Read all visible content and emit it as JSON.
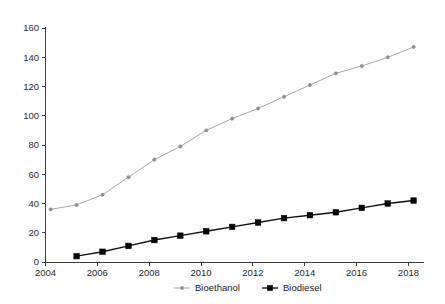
{
  "chart_data": {
    "type": "line",
    "title": "",
    "subtitle": "",
    "xlabel": "",
    "ylabel": "",
    "xlim": [
      2004,
      2018.6
    ],
    "ylim": [
      0,
      160
    ],
    "grid": false,
    "legend_position": "bottom-center",
    "x_ticks": [
      "2004",
      "2006",
      "2008",
      "2010",
      "2012",
      "2014",
      "2016",
      "2018"
    ],
    "x_tick_values": [
      2004,
      2006,
      2008,
      2010,
      2012,
      2014,
      2016,
      2018
    ],
    "y_ticks": [
      "0",
      "20",
      "40",
      "60",
      "80",
      "100",
      "120",
      "140",
      "160"
    ],
    "y_tick_values": [
      0,
      20,
      40,
      60,
      80,
      100,
      120,
      140,
      160
    ],
    "series": [
      {
        "name": "Bioethanol",
        "color": "#a8a8a8",
        "marker": "circle",
        "x": [
          2004.2,
          2005.2,
          2006.2,
          2007.2,
          2008.2,
          2009.2,
          2010.2,
          2011.2,
          2012.2,
          2013.2,
          2014.2,
          2015.2,
          2016.2,
          2017.2,
          2018.2
        ],
        "values": [
          36,
          39,
          46,
          58,
          70,
          79,
          90,
          98,
          105,
          113,
          121,
          129,
          134,
          140,
          147
        ]
      },
      {
        "name": "Biodiesel",
        "color": "#000000",
        "marker": "square",
        "x": [
          2005.2,
          2006.2,
          2007.2,
          2008.2,
          2009.2,
          2010.2,
          2011.2,
          2012.2,
          2013.2,
          2014.2,
          2015.2,
          2016.2,
          2017.2,
          2018.2
        ],
        "values": [
          4,
          7,
          11,
          15,
          18,
          21,
          24,
          27,
          30,
          32,
          34,
          37,
          40,
          42
        ]
      }
    ]
  },
  "legend": {
    "items": [
      {
        "label": "Bioethanol"
      },
      {
        "label": "Biodiesel"
      }
    ]
  }
}
